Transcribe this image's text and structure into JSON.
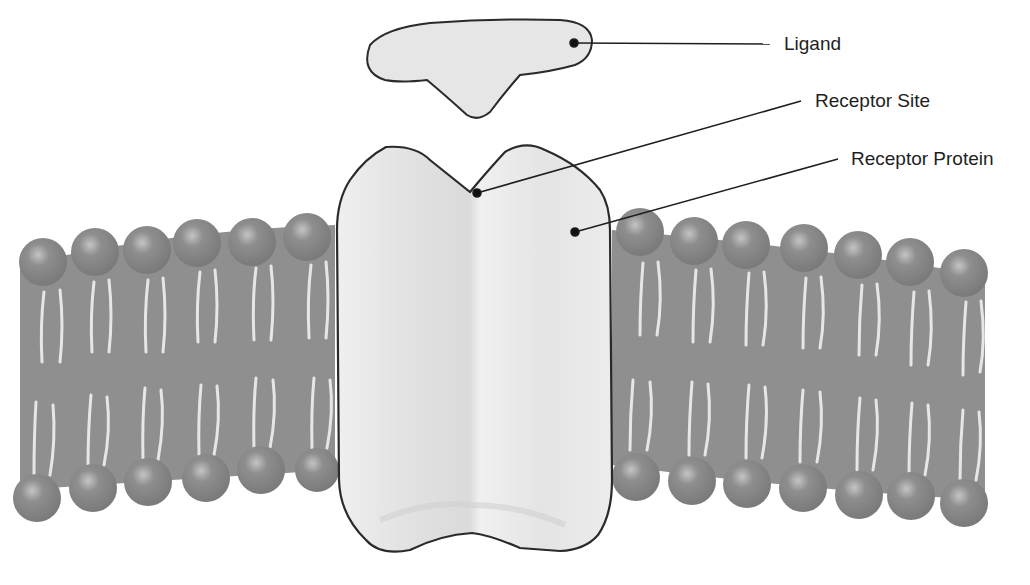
{
  "diagram": {
    "type": "cell-membrane-receptor",
    "labels": {
      "ligand": "Ligand",
      "receptor_site": "Receptor Site",
      "receptor_protein": "Receptor Protein"
    },
    "colors": {
      "background": "#ffffff",
      "membrane": "#8f8f8f",
      "head": "#8a8a8a",
      "tail": "#e4e4e4",
      "protein": "#ececec",
      "outline": "#2a2a2a",
      "leader_line": "#1e1e1e"
    },
    "components": [
      "ligand",
      "receptor protein",
      "receptor site",
      "phospholipid bilayer"
    ]
  }
}
